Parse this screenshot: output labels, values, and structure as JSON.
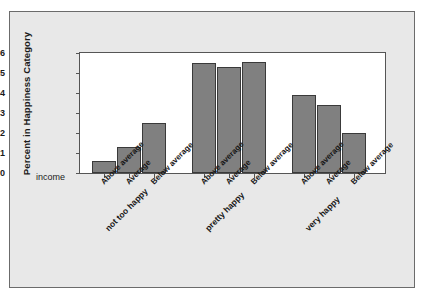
{
  "figure": {
    "background_color": "#e8e8e8",
    "plot_background_color": "#ffffff",
    "bar_color": "#808080",
    "bar_edge_color": "#3a3a3a",
    "axis_color": "#555555"
  },
  "axis": {
    "y_title": "Percent in Happiness Category",
    "x_group_title": "income",
    "y_ticks": [
      "0.0",
      "0.1",
      "0.2",
      "0.3",
      "0.4",
      "0.5",
      "0.6"
    ]
  },
  "chart_data": {
    "type": "bar",
    "title": "",
    "xlabel": "income",
    "ylabel": "Percent in Happiness Category",
    "ylim": [
      0,
      0.6
    ],
    "grid": false,
    "legend": "none",
    "categories": [
      "not too happy",
      "pretty happy",
      "very happy"
    ],
    "subcategories": [
      "Above average",
      "Average",
      "Below average"
    ],
    "series": [
      {
        "name": "Above average",
        "values": [
          0.06,
          0.55,
          0.39
        ]
      },
      {
        "name": "Average",
        "values": [
          0.13,
          0.53,
          0.34
        ]
      },
      {
        "name": "Below average",
        "values": [
          0.25,
          0.555,
          0.2
        ]
      }
    ],
    "bars": [
      {
        "group": "not too happy",
        "subcategory": "Above average",
        "value": 0.06
      },
      {
        "group": "not too happy",
        "subcategory": "Average",
        "value": 0.13
      },
      {
        "group": "not too happy",
        "subcategory": "Below average",
        "value": 0.25
      },
      {
        "group": "pretty happy",
        "subcategory": "Above average",
        "value": 0.55
      },
      {
        "group": "pretty happy",
        "subcategory": "Average",
        "value": 0.53
      },
      {
        "group": "pretty happy",
        "subcategory": "Below average",
        "value": 0.555
      },
      {
        "group": "very happy",
        "subcategory": "Above average",
        "value": 0.39
      },
      {
        "group": "very happy",
        "subcategory": "Average",
        "value": 0.34
      },
      {
        "group": "very happy",
        "subcategory": "Below average",
        "value": 0.2
      }
    ]
  }
}
